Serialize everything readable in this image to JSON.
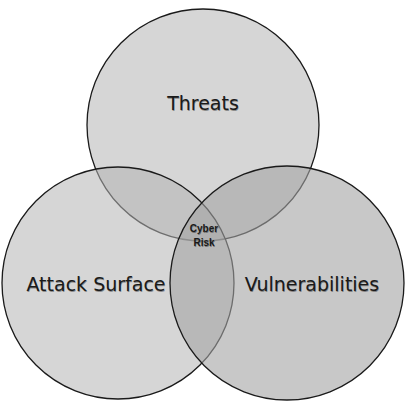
{
  "diagram": {
    "type": "venn",
    "sets": [
      {
        "name": "threats",
        "label": "Threats",
        "cx": 203,
        "cy": 125,
        "r": 116
      },
      {
        "name": "attack-surface",
        "label": "Attack Surface",
        "cx": 118,
        "cy": 283,
        "r": 116
      },
      {
        "name": "vulnerabilities",
        "label": "Vulnerabilities",
        "cx": 287,
        "cy": 283,
        "r": 117
      }
    ],
    "intersection": {
      "line1": "Cyber",
      "line2": "Risk"
    },
    "colors": {
      "fill": "#9a9a9a",
      "stroke": "#1a1a1a",
      "background": "#ffffff"
    }
  }
}
